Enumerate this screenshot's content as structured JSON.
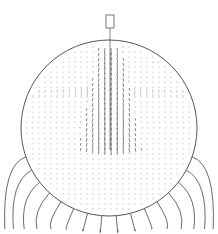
{
  "figure": {
    "type": "velocity-vector-field",
    "colors": {
      "background": "#ffffff",
      "outline": "#555555",
      "vectors": "#333333",
      "field_lines": "#444444"
    },
    "droplet": {
      "cx": 109,
      "cy": 128,
      "r": 88
    },
    "capillary": {
      "x": 106,
      "y": 15,
      "width": 8,
      "height": 13
    },
    "field_line_count": 16
  }
}
